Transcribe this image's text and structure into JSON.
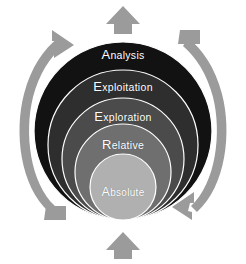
{
  "diagram": {
    "type": "concentric-onion",
    "title": "",
    "background_color": "#ffffff",
    "layers": [
      {
        "id": "analysis",
        "label": "Analysis",
        "cap": "A",
        "rest": "nalysis",
        "fill": "#121212",
        "stroke": "#ffffff",
        "order": 1,
        "level": "outermost"
      },
      {
        "id": "exploitation",
        "label": "Exploitation",
        "cap": "E",
        "rest": "xploitation",
        "fill": "#2e2e2e",
        "stroke": "#ffffff",
        "order": 2,
        "level": "second"
      },
      {
        "id": "exploration",
        "label": "Exploration",
        "cap": "E",
        "rest": "xploration",
        "fill": "#4b4b4b",
        "stroke": "#ffffff",
        "order": 3,
        "level": "third"
      },
      {
        "id": "relative",
        "label": "Relative",
        "cap": "R",
        "rest": "elative",
        "fill": "#6f6f6f",
        "stroke": "#ffffff",
        "order": 4,
        "level": "fourth"
      },
      {
        "id": "absolute",
        "label": "Absolute",
        "cap": "A",
        "rest": "bsolute",
        "fill": "#b0b0b0",
        "stroke": "#ffffff",
        "order": 5,
        "level": "innermost"
      }
    ],
    "arrows": {
      "color": "#9b9b9b",
      "top_arrow": {
        "name": "top-up-arrow",
        "direction": "up"
      },
      "bottom_arrow": {
        "name": "bottom-up-arrow",
        "direction": "up"
      },
      "left_arc": {
        "name": "left-curved-arrow",
        "direction": "upward"
      },
      "right_arc": {
        "name": "right-curved-arrow",
        "direction": "downward"
      }
    }
  }
}
